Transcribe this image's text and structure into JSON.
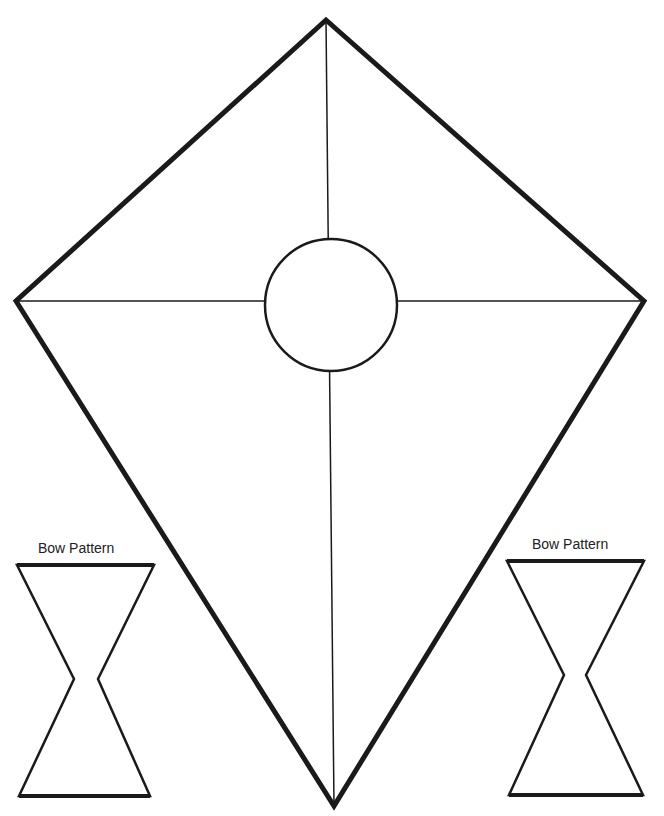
{
  "kite": {
    "outline_points": [
      [
        326,
        20
      ],
      [
        644,
        301
      ],
      [
        334,
        806
      ],
      [
        16,
        301
      ]
    ],
    "vertical_spar": {
      "x1": 326,
      "y1": 20,
      "x2": 334,
      "y2": 806
    },
    "horizontal_spar": {
      "x1": 16,
      "y1": 301,
      "x2": 644,
      "y2": 301
    },
    "center_circle": {
      "cx": 331,
      "cy": 305,
      "r": 66
    },
    "stroke_color": "#1a1a1a"
  },
  "bows": [
    {
      "label": "Bow Pattern",
      "points": [
        [
          17,
          565
        ],
        [
          154,
          565
        ],
        [
          98,
          679
        ],
        [
          150,
          796
        ],
        [
          19,
          796
        ],
        [
          74,
          679
        ]
      ]
    },
    {
      "label": "Bow Pattern",
      "points": [
        [
          507,
          561
        ],
        [
          644,
          561
        ],
        [
          586,
          675
        ],
        [
          643,
          795
        ],
        [
          509,
          795
        ],
        [
          564,
          675
        ]
      ]
    }
  ]
}
